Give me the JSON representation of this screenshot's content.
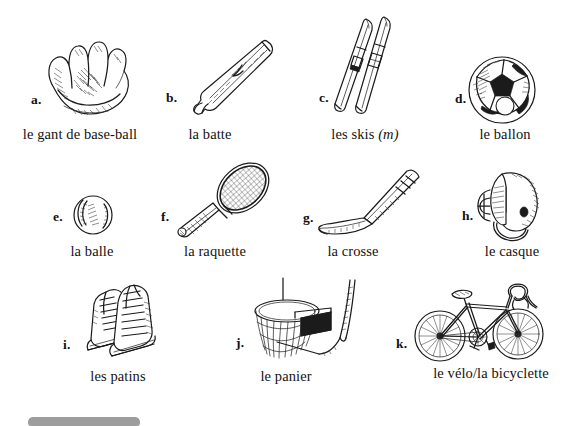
{
  "page": {
    "background_color": "#ffffff",
    "ink_color": "#1b1b1b",
    "grey_bar_color": "#9d9d9d"
  },
  "items": [
    {
      "marker": "a.",
      "caption": "le gant de base-ball",
      "icon": "baseball-glove-illustration"
    },
    {
      "marker": "b.",
      "caption": "la batte",
      "icon": "baseball-bat-illustration"
    },
    {
      "marker": "c.",
      "caption": "les skis ",
      "gender": "(m)",
      "icon": "skis-illustration"
    },
    {
      "marker": "d.",
      "caption": "le ballon",
      "icon": "soccer-ball-illustration"
    },
    {
      "marker": "e.",
      "caption": "la balle",
      "icon": "baseball-illustration"
    },
    {
      "marker": "f.",
      "caption": "la raquette",
      "icon": "tennis-racket-illustration"
    },
    {
      "marker": "g.",
      "caption": "la crosse",
      "icon": "hockey-stick-illustration"
    },
    {
      "marker": "h.",
      "caption": "le casque",
      "icon": "football-helmet-illustration"
    },
    {
      "marker": "i.",
      "caption": "les patins",
      "icon": "ice-skates-illustration"
    },
    {
      "marker": "j.",
      "caption": "le panier",
      "icon": "basketball-hoop-illustration"
    },
    {
      "marker": "k.",
      "caption": "le vélo/la bicyclette",
      "icon": "bicycle-illustration"
    }
  ]
}
